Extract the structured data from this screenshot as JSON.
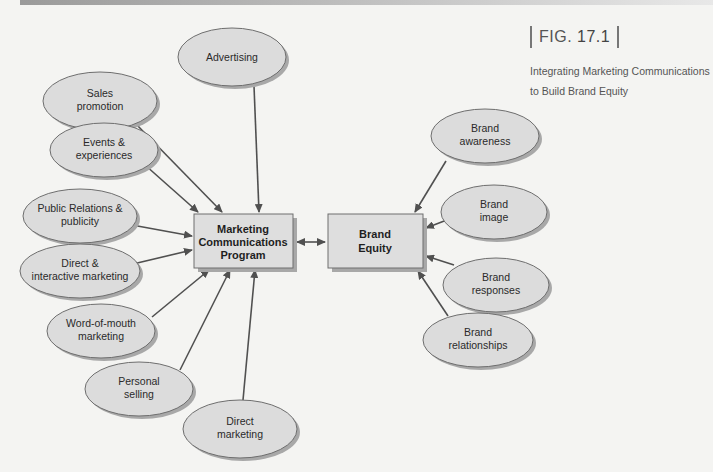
{
  "figure": {
    "label_prefix": "FIG.",
    "number": "17.1",
    "caption_line1": "Integrating Marketing Communications",
    "caption_line2": "to Build Brand Equity"
  },
  "center": {
    "program_box": {
      "line1": "Marketing",
      "line2": "Communications",
      "line3": "Program"
    },
    "equity_box": {
      "line1": "Brand",
      "line2": "Equity"
    }
  },
  "inputs": [
    {
      "line1": "Advertising",
      "line2": ""
    },
    {
      "line1": "Sales",
      "line2": "promotion"
    },
    {
      "line1": "Events &",
      "line2": "experiences"
    },
    {
      "line1": "Public Relations &",
      "line2": "publicity"
    },
    {
      "line1": "Direct &",
      "line2": "interactive marketing"
    },
    {
      "line1": "Word-of-mouth",
      "line2": "marketing"
    },
    {
      "line1": "Personal",
      "line2": "selling"
    },
    {
      "line1": "Direct",
      "line2": "marketing"
    }
  ],
  "outcomes": [
    {
      "line1": "Brand",
      "line2": "awareness"
    },
    {
      "line1": "Brand",
      "line2": "image"
    },
    {
      "line1": "Brand",
      "line2": "responses"
    },
    {
      "line1": "Brand",
      "line2": "relationships"
    }
  ],
  "colors": {
    "ellipse_fill": "#dcdcdc",
    "ellipse_stroke": "#6e6e6e",
    "shadow": "#a8a8a8",
    "box_fill": "#dedede",
    "arrow": "#505050"
  }
}
